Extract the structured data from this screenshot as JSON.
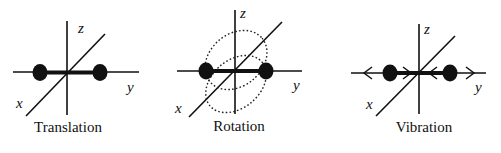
{
  "panels": [
    {
      "id": "translation",
      "caption": "Translation",
      "axes": {
        "x": "x",
        "y": "y",
        "z": "z"
      }
    },
    {
      "id": "rotation",
      "caption": "Rotation",
      "axes": {
        "x": "x",
        "y": "y",
        "z": "z"
      }
    },
    {
      "id": "vibration",
      "caption": "Vibration",
      "axes": {
        "x": "x",
        "y": "y",
        "z": "z"
      }
    }
  ],
  "colors": {
    "ink": "#111111",
    "background": "#ffffff"
  }
}
